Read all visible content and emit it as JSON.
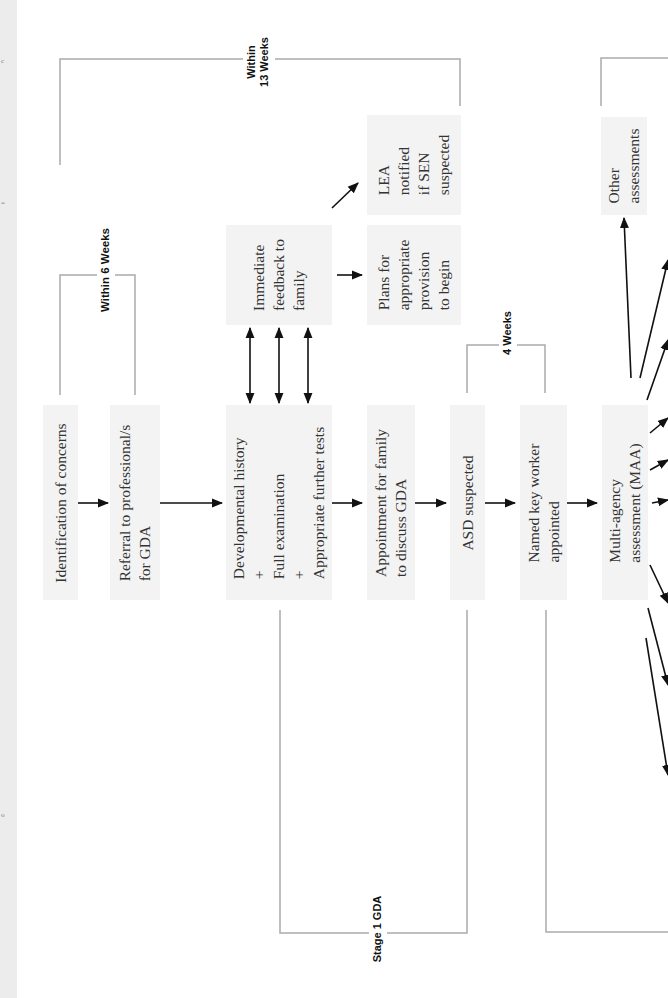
{
  "diagram": {
    "orientation": "rotated-90-ccw",
    "colors": {
      "box_fill": "#f3f3f3",
      "bracket_line": "#aaaaaa",
      "arrow": "#111111",
      "text": "#333333"
    },
    "boxes": {
      "identification": "Identification of concerns",
      "referral": "Referral to professional/s\nfor GDA",
      "developmental": "Developmental history\n+\nFull examination\n+\nAppropriate further tests",
      "feedback": "Immediate\nfeedback to\nfamily",
      "plans": "Plans for\nappropriate\nprovision\nto begin",
      "lea": "LEA\nnotified\nif SEN\nsuspected",
      "appointment": "Appointment for family\nto discuss GDA",
      "asd": "ASD suspected",
      "key_worker": "Named key worker\nappointed",
      "maa": "Multi-agency\nassessment (MAA)",
      "other": "Other\nassessments"
    },
    "brackets": {
      "within_13_weeks": "Within\n13 Weeks",
      "within_6_weeks": "Within 6 Weeks",
      "four_weeks": "4 Weeks",
      "stage_1_gda": "Stage 1 GDA"
    },
    "margin_marks": [
      "c",
      "=",
      "o"
    ]
  }
}
